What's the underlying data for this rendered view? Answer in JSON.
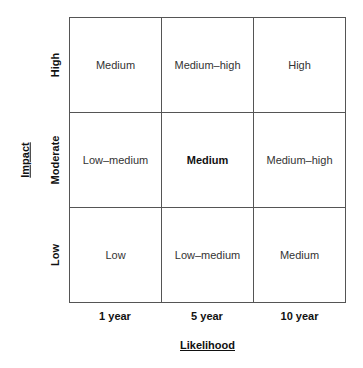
{
  "axes": {
    "y_title": "Impact",
    "x_title": "Likelihood",
    "rows": [
      "High",
      "Moderate",
      "Low"
    ],
    "columns": [
      "1 year",
      "5 year",
      "10 year"
    ]
  },
  "matrix": [
    [
      "Medium",
      "Medium–high",
      "High"
    ],
    [
      "Low–medium",
      "Medium",
      "Medium–high"
    ],
    [
      "Low",
      "Low–medium",
      "Medium"
    ]
  ],
  "emphasis": {
    "row": 1,
    "col": 1
  }
}
